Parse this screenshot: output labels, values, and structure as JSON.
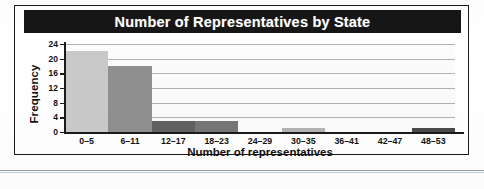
{
  "figure": {
    "title": "Number of Representatives by State",
    "title_bg_color": "#161616",
    "title_text_color": "#ffffff",
    "frame_border_color": "#1a1a1a",
    "rule_color": "#8a9aa6"
  },
  "chart_data": {
    "type": "bar",
    "title": "Number of Representatives by State",
    "xlabel": "Number of representatives",
    "ylabel": "Frequency",
    "categories": [
      "0–5",
      "6–11",
      "12–17",
      "18–23",
      "24–29",
      "30–35",
      "36–41",
      "42–47",
      "48–53"
    ],
    "values": [
      22,
      18,
      3,
      3,
      0,
      1,
      0,
      0,
      1
    ],
    "bar_colors": [
      "#c9c9c9",
      "#8f8f8f",
      "#616161",
      "#767676",
      "#c9c9c9",
      "#b3b3b3",
      "#c9c9c9",
      "#c9c9c9",
      "#4a4a4a"
    ],
    "ylim": [
      0,
      24
    ],
    "yticks": [
      0,
      4,
      8,
      12,
      16,
      20,
      24
    ],
    "ytick_labels": [
      "0",
      "4",
      "8",
      "12",
      "16",
      "20",
      "24"
    ],
    "grid": true,
    "grid_color": "#9a9a9a",
    "legend": null,
    "axis_color": "#1a1a1a"
  }
}
